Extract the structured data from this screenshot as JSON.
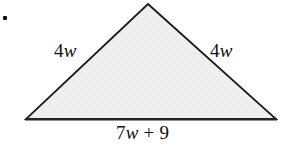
{
  "figure": {
    "name": "isosceles-triangle-perimeter-figure",
    "background_color": "#ffffff",
    "bullet": {
      "glyph": "•",
      "color": "#0d0d0d"
    },
    "shape": {
      "type": "triangle",
      "fill_color": "#f0f0f0",
      "stroke_color": "#1a1a1a",
      "stroke_width": 1.8,
      "vertices": [
        {
          "name": "apex",
          "x": 148,
          "y": 4
        },
        {
          "name": "bottom-right",
          "x": 276,
          "y": 119
        },
        {
          "name": "bottom-left",
          "x": 26,
          "y": 119
        }
      ]
    },
    "labels": {
      "left_side": {
        "coefficient": "4",
        "variable": "w"
      },
      "right_side": {
        "coefficient": "4",
        "variable": "w"
      },
      "base": {
        "coefficient": "7",
        "variable": "w",
        "operator": "+",
        "constant": "9"
      }
    }
  }
}
